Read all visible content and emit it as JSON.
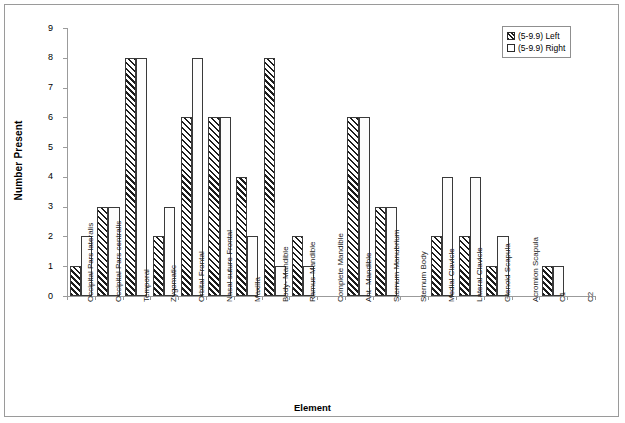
{
  "chart_data": {
    "type": "bar",
    "title": "",
    "xlabel": "Element",
    "ylabel": "Number Present",
    "ylim": [
      0,
      9
    ],
    "ytick_labels": [
      "0",
      "1",
      "2",
      "3",
      "4",
      "5",
      "6",
      "7",
      "8",
      "9"
    ],
    "grid": false,
    "legend_position": "top-right",
    "categories": [
      "Occipital Pars lateralis",
      "Occipital Pars centralis",
      "Temporal",
      "Zygomatic",
      "Orbital Frontal",
      "Nasal suture Frontal",
      "Maxilla",
      "Body- Mandible",
      "Ramus-Mandible",
      "Complete Mandible",
      "Ant- Mandible",
      "Sternum Manubrium",
      "Sternum Body",
      "Medial Clavicle",
      "Lateral Clavicle",
      "Glenoid Scapula",
      "Acromion Scapula",
      "C1",
      "C2"
    ],
    "series": [
      {
        "name": "(5-9.9) Left",
        "pattern": "diagonal-hatch",
        "values": [
          1,
          3,
          8,
          2,
          6,
          6,
          4,
          8,
          2,
          0,
          6,
          3,
          0,
          2,
          2,
          1,
          0,
          1,
          0
        ]
      },
      {
        "name": "(5-9.9) Right",
        "pattern": "dotted",
        "values": [
          2,
          3,
          8,
          3,
          8,
          6,
          2,
          1,
          1,
          0,
          6,
          3,
          0,
          4,
          4,
          2,
          0,
          1,
          0
        ]
      }
    ]
  },
  "legend": {
    "entries": [
      {
        "label": "(5-9.9) Left"
      },
      {
        "label": "(5-9.9) Right"
      }
    ]
  },
  "axes": {
    "x_title": "Element",
    "y_title": "Number Present"
  }
}
